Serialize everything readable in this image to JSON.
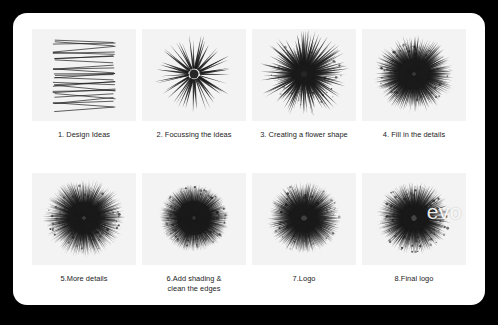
{
  "board": {
    "background_color": "#000000",
    "card_color": "#ffffff",
    "panel_color": "#f3f3f3",
    "caption_color": "#222222",
    "ink_color": "#1a1a1a"
  },
  "steps": [
    {
      "number": "1.",
      "caption": "1. Design Ideas",
      "caption_line1": "1. Design Ideas",
      "caption_line2": "",
      "art": "zigzag-lines",
      "art_name": "zigzag-sketch-thumbnail",
      "wordmark": ""
    },
    {
      "number": "2.",
      "caption": "2. Focussing the ideas",
      "caption_line1": "2. Focussing the ideas",
      "caption_line2": "",
      "art": "starburst",
      "art_name": "starburst-thumbnail",
      "wordmark": ""
    },
    {
      "number": "3.",
      "caption": "3. Creating a flower shape",
      "caption_line1": "3. Creating a flower shape",
      "caption_line2": "",
      "art": "burst",
      "art_name": "flower-shape-thumbnail",
      "wordmark": ""
    },
    {
      "number": "4.",
      "caption": "4. Fill in the details",
      "caption_line1": "4. Fill in the details",
      "caption_line2": "",
      "art": "burst",
      "art_name": "detailed-burst-thumbnail",
      "wordmark": ""
    },
    {
      "number": "5.",
      "caption": "5.More details",
      "caption_line1": "5.More details",
      "caption_line2": "",
      "art": "burst",
      "art_name": "dense-burst-thumbnail",
      "wordmark": ""
    },
    {
      "number": "6.",
      "caption": "6.Add shading & clean the edges",
      "caption_line1": "6.Add shading &",
      "caption_line2": "clean the edges",
      "art": "burst",
      "art_name": "shaded-burst-thumbnail",
      "wordmark": ""
    },
    {
      "number": "7.",
      "caption": "7.Logo",
      "caption_line1": "7.Logo",
      "caption_line2": "",
      "art": "burst",
      "art_name": "logo-burst-thumbnail",
      "wordmark": ""
    },
    {
      "number": "8.",
      "caption": "8.Final logo",
      "caption_line1": "8.Final logo",
      "caption_line2": "",
      "art": "burst",
      "art_name": "final-logo-thumbnail",
      "wordmark": "evo"
    }
  ],
  "art_params": [
    {
      "kind": "zigzag",
      "rows": 16,
      "seed": 11,
      "stroke": 0.85,
      "opacity": 0.82
    },
    {
      "kind": "burst",
      "spikes": 44,
      "seed": 21,
      "r_outer": 37,
      "r_inner": 5,
      "width": 2.1,
      "jitter": 0.1,
      "opacity": 0.88,
      "core": 4.5,
      "fuzz": 0
    },
    {
      "kind": "burst",
      "spikes": 150,
      "seed": 33,
      "r_outer": 36,
      "r_inner": 3,
      "width": 2.6,
      "jitter": 0.3,
      "opacity": 0.8,
      "core": 9,
      "fuzz": 60
    },
    {
      "kind": "burst",
      "spikes": 340,
      "seed": 47,
      "r_outer": 35,
      "r_inner": 2,
      "width": 2.2,
      "jitter": 0.18,
      "opacity": 0.72,
      "core": 15,
      "fuzz": 140
    },
    {
      "kind": "burst",
      "spikes": 430,
      "seed": 59,
      "r_outer": 36,
      "r_inner": 2,
      "width": 1.7,
      "jitter": 0.16,
      "opacity": 0.7,
      "core": 16,
      "fuzz": 180
    },
    {
      "kind": "burst",
      "spikes": 480,
      "seed": 71,
      "r_outer": 33,
      "r_inner": 2,
      "width": 1.5,
      "jitter": 0.08,
      "opacity": 0.74,
      "core": 17,
      "fuzz": 200
    },
    {
      "kind": "burst",
      "spikes": 380,
      "seed": 83,
      "r_outer": 34,
      "r_inner": 3,
      "width": 1.8,
      "jitter": 0.12,
      "opacity": 0.68,
      "core": 13,
      "fuzz": 150
    },
    {
      "kind": "burst",
      "spikes": 360,
      "seed": 97,
      "r_outer": 34,
      "r_inner": 3,
      "width": 1.9,
      "jitter": 0.13,
      "opacity": 0.66,
      "core": 12,
      "fuzz": 150
    }
  ],
  "bottom_strip": {
    "text": ""
  }
}
